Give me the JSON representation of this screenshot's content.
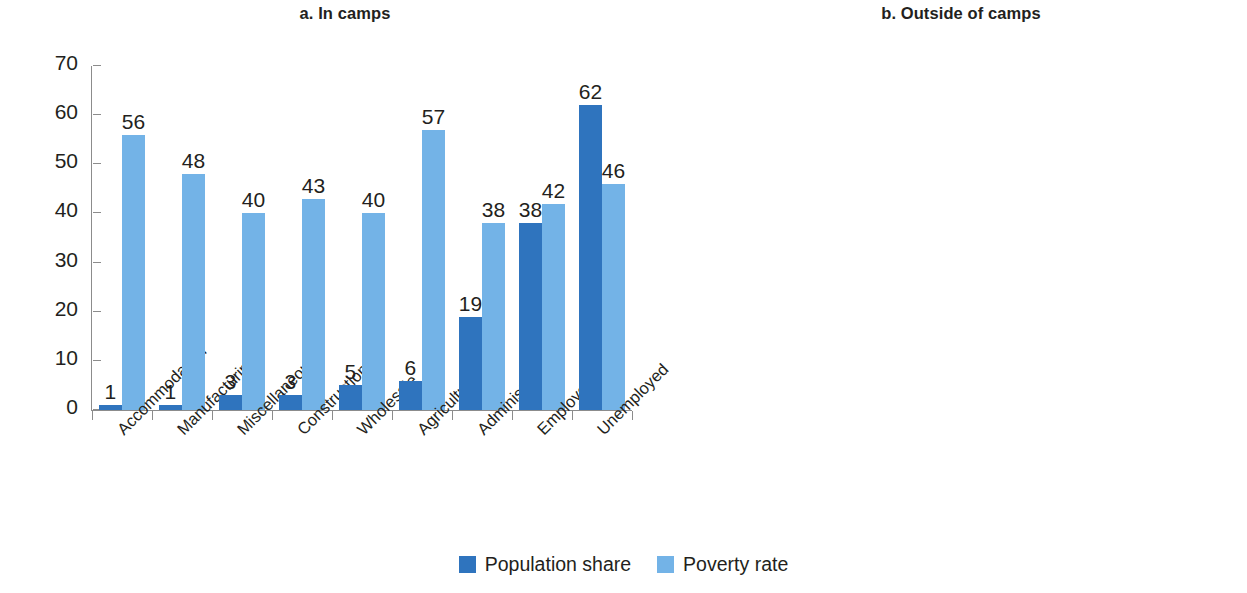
{
  "colors": {
    "population_share": "#2f74be",
    "poverty_rate": "#73b3e7",
    "axis": "#8c8c8c",
    "text": "#231f20"
  },
  "legend": {
    "items": [
      {
        "label": "Population share",
        "color": "#2f74be"
      },
      {
        "label": "Poverty rate",
        "color": "#73b3e7"
      }
    ]
  },
  "yticks": [
    "0",
    "10",
    "20",
    "30",
    "40",
    "50",
    "60",
    "70"
  ],
  "panels": [
    {
      "id": "a",
      "title": "a. In camps"
    },
    {
      "id": "b",
      "title": "b. Outside of camps"
    }
  ],
  "chart_data": [
    {
      "type": "bar",
      "title": "a. In camps",
      "xlabel": "",
      "ylabel": "",
      "ylim": [
        0,
        70
      ],
      "ytick_step": 10,
      "grid": false,
      "legend_position": "bottom-center",
      "categories": [
        "Accommodation",
        "Manufacturing",
        "Miscellaneous",
        "Construction",
        "Wholesale",
        "Agriculture",
        "Administrative",
        "Employed",
        "Unemployed"
      ],
      "series": [
        {
          "name": "Population share",
          "color": "#2f74be",
          "values": [
            1,
            1,
            3,
            3,
            5,
            6,
            19,
            38,
            62
          ]
        },
        {
          "name": "Poverty rate",
          "color": "#73b3e7",
          "values": [
            56,
            48,
            40,
            43,
            40,
            57,
            38,
            42,
            46
          ]
        }
      ]
    },
    {
      "type": "bar",
      "title": "b. Outside of camps",
      "xlabel": "",
      "ylabel": "",
      "ylim": [
        0,
        70
      ],
      "ytick_step": 10,
      "grid": false,
      "legend_position": "bottom-center",
      "categories": [
        "Electricity or gas",
        "Administrative",
        "Transportation",
        "Miscellaneous",
        "Wholesale",
        "Agriculture",
        "Manufacturing",
        "Accommodation",
        "Construction",
        "Employed",
        "Unemployed"
      ],
      "series": [
        {
          "name": "Population share",
          "color": "#2f74be",
          "values": [
            1,
            1,
            4,
            4,
            4,
            5,
            5,
            6,
            16,
            46,
            54
          ]
        },
        {
          "name": "Poverty rate",
          "color": "#73b3e7",
          "values": [
            51,
            26,
            66,
            57,
            50,
            69,
            45,
            49,
            67,
            58,
            65
          ]
        }
      ]
    }
  ]
}
